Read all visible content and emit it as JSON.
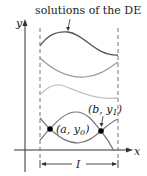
{
  "title": "solutions of the DE",
  "axes": {
    "x_label": "x",
    "y_label": "y"
  },
  "points": [
    {
      "label": "(a, y0)",
      "text": "(a, y",
      "sub": "0",
      "close": ")"
    },
    {
      "label": "(b, y1)",
      "text": "(b, y",
      "sub": "1",
      "close": ")"
    }
  ],
  "interval_label": "I",
  "colors": {
    "dark_curve": "#555555",
    "medium_curve": "#9a9a9a",
    "light_curve": "#c2c2c2",
    "axis": "#333333",
    "dashed": "#666666",
    "point": "#000000"
  }
}
